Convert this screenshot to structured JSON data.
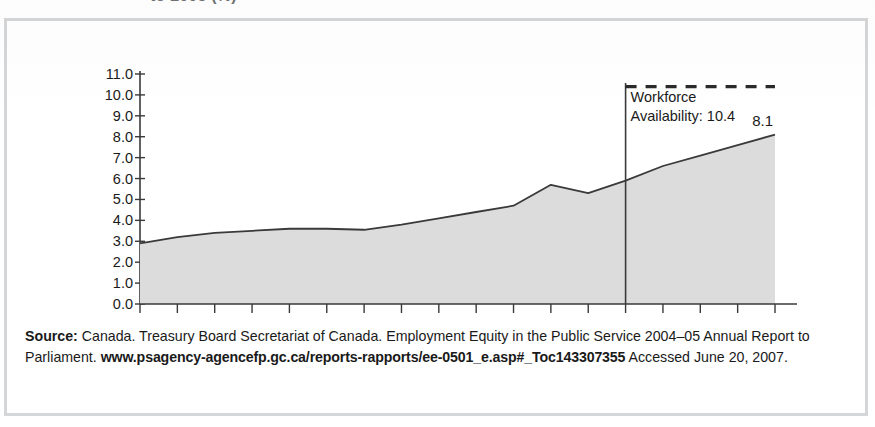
{
  "figure": {
    "title_fragment": "to 2005 (%)"
  },
  "chart_data": {
    "type": "area",
    "title": "to 2005 (%)",
    "xlabel": "",
    "ylabel": "",
    "x": [
      1988,
      1989,
      1990,
      1991,
      1992,
      1993,
      1994,
      1995,
      1996,
      1997,
      1998,
      1999,
      2000,
      2001,
      2002,
      2003,
      2004,
      2005
    ],
    "values": [
      2.9,
      3.2,
      3.4,
      3.5,
      3.6,
      3.6,
      3.55,
      3.8,
      4.1,
      4.4,
      4.7,
      5.7,
      5.3,
      5.9,
      6.6,
      7.1,
      7.6,
      8.1
    ],
    "series": [
      {
        "name": "Representation",
        "values": [
          2.9,
          3.2,
          3.4,
          3.5,
          3.6,
          3.6,
          3.55,
          3.8,
          4.1,
          4.4,
          4.7,
          5.7,
          5.3,
          5.9,
          6.6,
          7.1,
          7.6,
          8.1
        ]
      }
    ],
    "xlim": [
      1988,
      2005
    ],
    "ylim": [
      0.0,
      11.0
    ],
    "ytick_step": 1.0,
    "ytick_labels": [
      "0.0",
      "1.0",
      "2.0",
      "3.0",
      "4.0",
      "5.0",
      "6.0",
      "7.0",
      "8.0",
      "9.0",
      "10.0",
      "11.0"
    ],
    "xtick_labels": [
      "1988",
      "1990",
      "1992",
      "1994",
      "1996",
      "1998",
      "2000",
      "2002",
      "2004",
      "2005"
    ],
    "xtick_values": [
      1988,
      1990,
      1992,
      1994,
      1996,
      1998,
      2000,
      2002,
      2004,
      2005
    ],
    "xticks_minor_every": 1,
    "grid": false,
    "legend": "none",
    "area_fill": "#dcdcdc",
    "line_color": "#3a3a3a",
    "annotations": [
      {
        "name": "workforce-availability",
        "label_line1": "Workforce",
        "label_line2": "Availability: 10.4",
        "value": 10.4,
        "style": "dashed-horizontal-line",
        "start_x": 2001
      },
      {
        "name": "endpoint-value",
        "label": "8.1",
        "value": 8.1,
        "at_x": 2005
      },
      {
        "name": "reference-vertical-line",
        "at_x": 2001,
        "style": "solid-vertical-line"
      }
    ]
  },
  "source": {
    "label": "Source:",
    "line1_rest": " Canada. Treasury Board Secretariat of Canada. Employment Equity in the Public Service 2004–05 Annual",
    "line2_before": "Report to Parliament. ",
    "url": "www.psagency-agencefp.gc.ca/reports-rapports/ee-0501_e.asp#_Toc143307355",
    "line2_after": " Accessed",
    "line3": "June 20, 2007."
  }
}
